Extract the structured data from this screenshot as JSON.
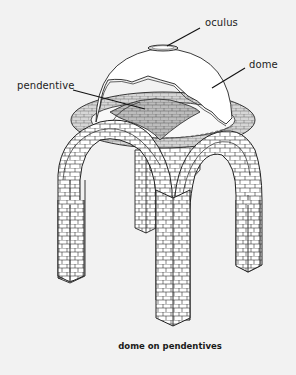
{
  "figure": {
    "title": "dome on pendentives",
    "background": "#f2f2f2",
    "line_color": "#222222",
    "pendentive_shade": "#b8b8b8",
    "ring_shade": "#d4d4d4",
    "labels": {
      "oculus": "oculus",
      "dome": "dome",
      "pendentive": "pendentive"
    },
    "caption": "dome on pendentives"
  }
}
